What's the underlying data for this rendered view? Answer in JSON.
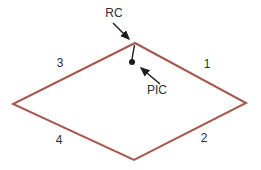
{
  "diagram": {
    "type": "annotated-rhombus",
    "colors": {
      "background": "#ffffff",
      "rhombus_stroke": "#a5594e",
      "annotation": "#1c1c1c",
      "label_text": "#2e2e2e"
    },
    "rhombus": {
      "points": "135,43 246,103 134,160 13,104",
      "stroke_width": "2"
    },
    "pic_marker": {
      "stem_d": "M134.5,45 L132,59",
      "dot_cx": "132",
      "dot_cy": "62",
      "dot_r": "3"
    },
    "arrows": {
      "rc_d": "M113,23 L129,39",
      "pic_d": "M160,84 L141,68"
    },
    "labels": {
      "rc": "RC",
      "pic": "PIC",
      "side_1": "1",
      "side_2": "2",
      "side_3": "3",
      "side_4": "4"
    }
  }
}
